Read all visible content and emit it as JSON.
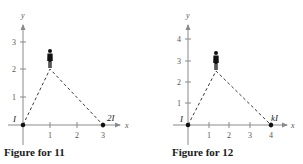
{
  "figures": [
    {
      "caption": "Figure for 11",
      "x_axis_label": "x",
      "y_axis_label": "y",
      "x_ticks": [
        "1",
        "2",
        "3"
      ],
      "y_ticks": [
        "1",
        "2",
        "3"
      ],
      "points": [
        {
          "label": "I",
          "x": 0,
          "y": 0
        },
        {
          "label": "2I",
          "x": 3,
          "y": 0
        }
      ],
      "observer": {
        "x": 1,
        "y": 2,
        "icon": "person-icon"
      }
    },
    {
      "caption": "Figure for 12",
      "x_axis_label": "x",
      "y_axis_label": "y",
      "x_ticks": [
        "1",
        "2",
        "3",
        "4"
      ],
      "y_ticks": [
        "1",
        "2",
        "3",
        "4"
      ],
      "points": [
        {
          "label": "I",
          "x": 0,
          "y": 0
        },
        {
          "label": "kI",
          "x": 4,
          "y": 0
        }
      ],
      "observer": {
        "x": 1.3,
        "y": 2.5,
        "icon": "person-icon"
      }
    }
  ]
}
